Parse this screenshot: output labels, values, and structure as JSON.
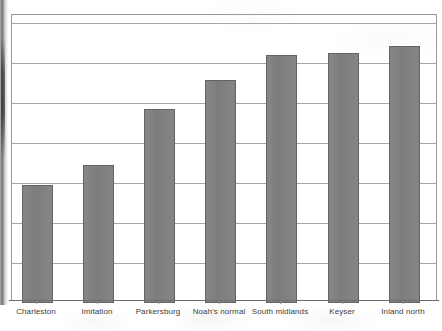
{
  "chart_data": {
    "type": "bar",
    "title": "",
    "subtitle": "",
    "xlabel": "",
    "ylabel": "",
    "categories": [
      "Charleston",
      "Imitation",
      "Parkersburg",
      "Noah's normal",
      "South midlands",
      "Keyser",
      "Inland north"
    ],
    "values": [
      117,
      137,
      193,
      222,
      247,
      249,
      256
    ],
    "ylim": [
      0,
      287
    ],
    "y_tick_labels": [],
    "gridlines": {
      "visible": true,
      "orientation": "horizontal",
      "count": 7,
      "positions": [
        22,
        62,
        102,
        142,
        182,
        222,
        262
      ]
    },
    "legend": {
      "visible": false,
      "position": "none"
    },
    "bar_color": "#7f7f7f",
    "bar_border_color": "#636363",
    "axis_color": "#9a9a9a",
    "grid_color": "#a8a8a8",
    "background_color": "#ffffff",
    "bars": [
      {
        "label": "Charleston",
        "x": 21,
        "width": 31,
        "top": 184,
        "height": 117
      },
      {
        "label": "Imitation",
        "x": 82,
        "width": 31,
        "top": 164,
        "height": 137
      },
      {
        "label": "Parkersburg",
        "x": 143,
        "width": 31,
        "top": 108,
        "height": 193
      },
      {
        "label": "Noah's normal",
        "x": 204,
        "width": 31,
        "top": 79,
        "height": 222
      },
      {
        "label": "South midlands",
        "x": 265,
        "width": 31,
        "top": 54,
        "height": 247
      },
      {
        "label": "Keyser",
        "x": 327,
        "width": 31,
        "top": 52,
        "height": 249
      },
      {
        "label": "Inland north",
        "x": 388,
        "width": 31,
        "top": 45,
        "height": 256
      }
    ],
    "tick_positions": [
      36,
      97,
      158,
      219,
      280,
      342,
      403
    ],
    "label_positions": [
      36,
      97,
      158,
      219,
      280,
      342,
      403
    ]
  }
}
